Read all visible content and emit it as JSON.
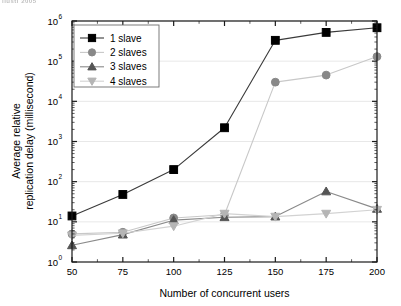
{
  "figure": {
    "header_fragment": "llusti 2005",
    "background_color": "#ffffff",
    "axis_color": "#1a1a1a",
    "grid_color": "#d9d9d9"
  },
  "chart_data": {
    "type": "line",
    "title": "",
    "xlabel": "Number of concurrent users",
    "ylabel": "Average relative replication delay (millisecond)",
    "ylabel_line1": "Average relative",
    "ylabel_line2": "replication delay (millisecond)",
    "x": [
      50,
      75,
      100,
      125,
      150,
      175,
      200
    ],
    "xtick_labels": [
      "50",
      "75",
      "100",
      "125",
      "150",
      "175",
      "200"
    ],
    "xlim": [
      50,
      200
    ],
    "yscale": "log",
    "ylim": [
      1,
      1000000
    ],
    "ytick_labels": [
      "10⁰",
      "10¹",
      "10²",
      "10³",
      "10⁴",
      "10⁵",
      "10⁶"
    ],
    "ytick_bases": [
      "10",
      "10",
      "10",
      "10",
      "10",
      "10",
      "10"
    ],
    "ytick_exponents": [
      "0",
      "1",
      "2",
      "3",
      "4",
      "5",
      "6"
    ],
    "ytick_values": [
      1,
      10,
      100,
      1000,
      10000,
      100000,
      1000000
    ],
    "grid": "horizontal",
    "legend_position": "upper-left",
    "series": [
      {
        "name": "1 slave",
        "marker": "square",
        "color": "#000000",
        "line_color": "#3a3a3a",
        "values": [
          14,
          48,
          200,
          2200,
          330000,
          520000,
          680000
        ]
      },
      {
        "name": "2 slaves",
        "marker": "circle",
        "color": "#888888",
        "line_color": "#c8c8c8",
        "values": [
          5,
          5.5,
          12.5,
          15,
          30000,
          45000,
          130000
        ]
      },
      {
        "name": "3 slaves",
        "marker": "triangle-up",
        "color": "#555555",
        "line_color": "#8a8a8a",
        "values": [
          2.6,
          4.8,
          11,
          13,
          13.5,
          57,
          21
        ]
      },
      {
        "name": "4 slaves",
        "marker": "triangle-down",
        "color": "#b5b5b5",
        "line_color": "#d2d2d2",
        "values": [
          4.6,
          5.2,
          7.8,
          16,
          13.5,
          16,
          20
        ]
      }
    ]
  }
}
